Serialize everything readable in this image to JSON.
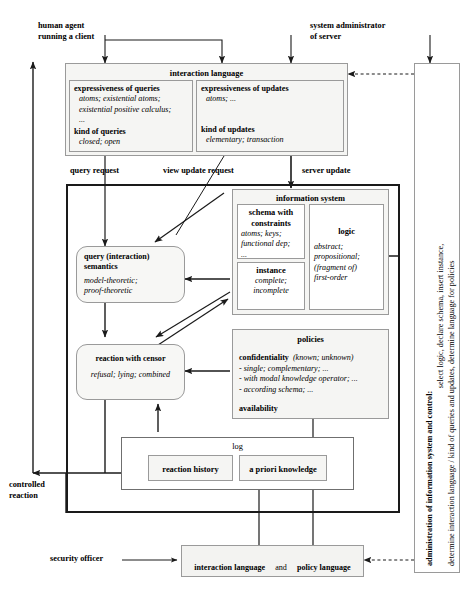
{
  "diagram": {
    "actors": {
      "human_agent": "human agent\nrunning a client",
      "system_administrator": "system administrator\nof server",
      "security_officer": "security officer",
      "controlled_reaction": "controlled\nreaction"
    },
    "edge_labels": {
      "query_request": "query  request",
      "view_update_request": "view update  request",
      "server_update": "server update"
    },
    "interaction_language": {
      "title": "interaction language",
      "left": {
        "heading1": "expressiveness of queries",
        "detail1": "atoms; existential atoms;\nexistential positive calculus;\n...",
        "heading2": "kind of queries",
        "detail2": "closed; open"
      },
      "right": {
        "heading1": "expressiveness of updates",
        "detail1": "atoms; ...",
        "heading2": "kind of updates",
        "detail2": "elementary; transaction"
      }
    },
    "information_system": {
      "title": "information system",
      "schema": {
        "title": "schema with\nconstraints",
        "detail": "atoms; keys;\nfunctional dep;\n..."
      },
      "instance": {
        "title": "instance",
        "detail": "complete;\nincomplete"
      },
      "logic": {
        "title": "logic",
        "detail": "abstract;\npropositional;\n(fragment of)\nfirst-order"
      }
    },
    "query_semantics": {
      "title": "query (interaction)\nsemantics",
      "detail": "model-theoretic;\nproof-theoretic"
    },
    "reaction_censor": {
      "title": "reaction with censor",
      "detail": "refusal; lying; combined"
    },
    "policies": {
      "title": "policies",
      "confidentiality_label": "confidentiality",
      "confidentiality_paren": "(known; unknown)",
      "items": [
        "- single; complementary; ...",
        "- with modal knowledge operator; ...",
        "- according schema; ..."
      ],
      "availability_label": "availability"
    },
    "log": {
      "title": "log",
      "reaction_history": "reaction  history",
      "a_priori_knowledge": "a priori knowledge"
    },
    "bottom_bar": {
      "interaction_language": "interaction language",
      "and": "and",
      "policy_language": "policy language"
    },
    "admin_panel": {
      "heading": "administration of information system and control:",
      "line2": "select logic,  declare schema,  insert instance,",
      "line3": "determine interaction language / kind of queries and updates, determine language for policies"
    },
    "colors": {
      "box_fill": "#f5f5f3",
      "box_border": "#9a9a9a",
      "thick_border": "#1a1a1a",
      "arrow": "#1a1a1a",
      "background": "#ffffff"
    }
  }
}
